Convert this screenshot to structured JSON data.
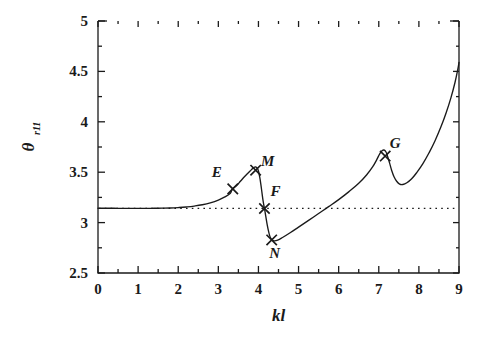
{
  "chart_data": {
    "type": "line",
    "title": "",
    "xlabel": "kl",
    "ylabel": "θ",
    "ylabel_sub": "r11",
    "xlim": [
      0,
      9
    ],
    "ylim": [
      2.5,
      5
    ],
    "xticks": [
      0,
      1,
      2,
      3,
      4,
      5,
      6,
      7,
      8,
      9
    ],
    "xticklabels": [
      "0",
      "1",
      "2",
      "3",
      "4",
      "5",
      "6",
      "7",
      "8",
      "9"
    ],
    "yticks": [
      2.5,
      3,
      3.5,
      4,
      4.5,
      5
    ],
    "yticklabels": [
      "2.5",
      "3",
      "3.5",
      "4",
      "4.5",
      "5"
    ],
    "minor_xticks": [
      0.5,
      1.5,
      2.5,
      3.5,
      4.5,
      5.5,
      6.5,
      7.5,
      8.5
    ],
    "minor_yticks": [
      2.75,
      3.25,
      3.75,
      4.25,
      4.75
    ],
    "grid": false,
    "legend": false,
    "line_color": "#1a1a1a",
    "reference_line": {
      "type": "horizontal-dotted",
      "value": 3.1416,
      "label": "pi",
      "style": "dotted"
    },
    "series": [
      {
        "name": "theta_r11",
        "style": "solid",
        "points": [
          [
            0.0,
            3.142
          ],
          [
            0.2,
            3.142
          ],
          [
            0.4,
            3.142
          ],
          [
            0.6,
            3.141
          ],
          [
            0.8,
            3.141
          ],
          [
            1.0,
            3.141
          ],
          [
            1.2,
            3.141
          ],
          [
            1.4,
            3.142
          ],
          [
            1.6,
            3.143
          ],
          [
            1.8,
            3.145
          ],
          [
            2.0,
            3.149
          ],
          [
            2.2,
            3.155
          ],
          [
            2.4,
            3.164
          ],
          [
            2.6,
            3.177
          ],
          [
            2.8,
            3.196
          ],
          [
            3.0,
            3.223
          ],
          [
            3.15,
            3.252
          ],
          [
            3.3,
            3.292
          ],
          [
            3.35,
            3.335
          ],
          [
            3.45,
            3.365
          ],
          [
            3.55,
            3.41
          ],
          [
            3.65,
            3.455
          ],
          [
            3.75,
            3.495
          ],
          [
            3.82,
            3.523
          ],
          [
            3.88,
            3.545
          ],
          [
            3.93,
            3.552
          ],
          [
            3.97,
            3.54
          ],
          [
            4.0,
            3.512
          ],
          [
            4.03,
            3.455
          ],
          [
            4.06,
            3.38
          ],
          [
            4.09,
            3.29
          ],
          [
            4.12,
            3.205
          ],
          [
            4.15,
            3.14
          ],
          [
            4.18,
            3.07
          ],
          [
            4.22,
            2.975
          ],
          [
            4.26,
            2.9
          ],
          [
            4.3,
            2.85
          ],
          [
            4.35,
            2.824
          ],
          [
            4.4,
            2.818
          ],
          [
            4.48,
            2.826
          ],
          [
            4.6,
            2.852
          ],
          [
            4.8,
            2.902
          ],
          [
            5.0,
            2.955
          ],
          [
            5.25,
            3.022
          ],
          [
            5.5,
            3.09
          ],
          [
            5.75,
            3.158
          ],
          [
            6.0,
            3.228
          ],
          [
            6.25,
            3.305
          ],
          [
            6.5,
            3.39
          ],
          [
            6.7,
            3.475
          ],
          [
            6.85,
            3.555
          ],
          [
            6.95,
            3.625
          ],
          [
            7.02,
            3.68
          ],
          [
            7.08,
            3.712
          ],
          [
            7.13,
            3.72
          ],
          [
            7.18,
            3.7
          ],
          [
            7.22,
            3.655
          ],
          [
            7.27,
            3.59
          ],
          [
            7.32,
            3.52
          ],
          [
            7.38,
            3.455
          ],
          [
            7.45,
            3.408
          ],
          [
            7.52,
            3.382
          ],
          [
            7.6,
            3.378
          ],
          [
            7.7,
            3.395
          ],
          [
            7.82,
            3.435
          ],
          [
            7.95,
            3.498
          ],
          [
            8.1,
            3.585
          ],
          [
            8.25,
            3.69
          ],
          [
            8.4,
            3.81
          ],
          [
            8.55,
            3.95
          ],
          [
            8.68,
            4.09
          ],
          [
            8.8,
            4.24
          ],
          [
            8.9,
            4.39
          ],
          [
            8.97,
            4.52
          ],
          [
            9.0,
            4.59
          ]
        ]
      }
    ],
    "annotations": [
      {
        "id": "E",
        "label": "E",
        "x": 3.36,
        "y": 3.335,
        "marker": "x",
        "label_dx": -16,
        "label_dy": -12
      },
      {
        "id": "M",
        "label": "M",
        "x": 3.93,
        "y": 3.52,
        "marker": "x",
        "label_dx": 12,
        "label_dy": -4
      },
      {
        "id": "F",
        "label": "F",
        "x": 4.15,
        "y": 3.14,
        "marker": "x",
        "label_dx": 11,
        "label_dy": -12
      },
      {
        "id": "N",
        "label": "N",
        "x": 4.33,
        "y": 2.828,
        "marker": "x",
        "label_dx": 3,
        "label_dy": 18
      },
      {
        "id": "G",
        "label": "G",
        "x": 7.16,
        "y": 3.66,
        "marker": "x",
        "label_dx": 10,
        "label_dy": -8
      }
    ]
  }
}
